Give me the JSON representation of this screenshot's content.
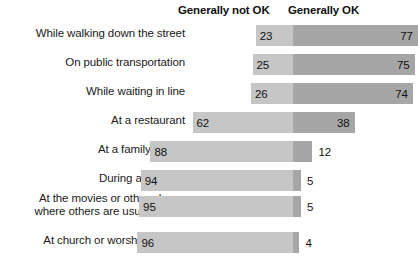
{
  "header": {
    "not_ok_label": "Generally not OK",
    "ok_label": "Generally OK"
  },
  "chart_data": {
    "type": "bar",
    "subtype": "stacked-horizontal-diverging",
    "title": "",
    "subtitle": "",
    "xlabel": "",
    "ylabel": "",
    "xlim": [
      0,
      100
    ],
    "grid": false,
    "legend_position": "top",
    "units": "percent",
    "categories": [
      "While walking down the street",
      "On public transportation",
      "While waiting in line",
      "At a restaurant",
      "At a family dinner",
      "During a meeting",
      "At the movies or other places where others are usually quiet",
      "At church or worship service"
    ],
    "series": [
      {
        "name": "Generally not OK",
        "color": "#c6c6c6",
        "values": [
          23,
          25,
          26,
          62,
          88,
          94,
          95,
          96
        ]
      },
      {
        "name": "Generally OK",
        "color": "#a6a6a6",
        "values": [
          77,
          75,
          74,
          38,
          12,
          5,
          5,
          4
        ]
      }
    ]
  },
  "rows": [
    {
      "label": "While walking down the street",
      "label_lines": [
        "While walking down the street"
      ],
      "not_ok": 23,
      "ok": 77,
      "ok_value_outside": false
    },
    {
      "label": "On public transportation",
      "label_lines": [
        "On public transportation"
      ],
      "not_ok": 25,
      "ok": 75,
      "ok_value_outside": false
    },
    {
      "label": "While waiting in line",
      "label_lines": [
        "While waiting in line"
      ],
      "not_ok": 26,
      "ok": 74,
      "ok_value_outside": false
    },
    {
      "label": "At a restaurant",
      "label_lines": [
        "At a restaurant"
      ],
      "not_ok": 62,
      "ok": 38,
      "ok_value_outside": false
    },
    {
      "label": "At a family dinner",
      "label_lines": [
        "At a family dinner"
      ],
      "not_ok": 88,
      "ok": 12,
      "ok_value_outside": true
    },
    {
      "label": "During a meeting",
      "label_lines": [
        "During a meeting"
      ],
      "not_ok": 94,
      "ok": 5,
      "ok_value_outside": true
    },
    {
      "label": "At the movies or other places where others are usually quiet",
      "label_lines": [
        "At the movies or other places",
        "where others are usually quiet"
      ],
      "not_ok": 95,
      "ok": 5,
      "ok_value_outside": true
    },
    {
      "label": "At church or worship service",
      "label_lines": [
        "At church or worship service"
      ],
      "not_ok": 96,
      "ok": 4,
      "ok_value_outside": true
    }
  ],
  "layout": {
    "row_tops": [
      25,
      54,
      83,
      112,
      141,
      170,
      196,
      232
    ],
    "label_tops": [
      27,
      56,
      85,
      114,
      143,
      172,
      192,
      234
    ],
    "bar_height": 21,
    "unit_px": 1.62,
    "divider_x": 102
  }
}
